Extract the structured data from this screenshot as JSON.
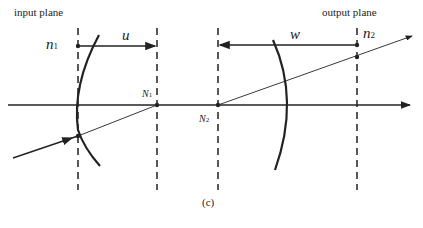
{
  "labels": {
    "input_plane": "input plane",
    "output_plane": "output plane",
    "n1": "n",
    "n1_sub": "1",
    "n2": "n",
    "n2_sub": "2",
    "u": "u",
    "w": "w",
    "N1": "N",
    "N1_sub": "1",
    "N2": "N",
    "N2_sub": "2",
    "caption": "(c)"
  },
  "colors": {
    "ink": "#222222",
    "background": "#ffffff"
  }
}
